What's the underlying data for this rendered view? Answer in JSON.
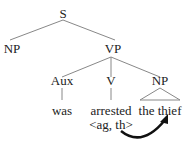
{
  "tree": {
    "root": "S",
    "s_children": [
      "NP",
      "VP"
    ],
    "vp_children": [
      "Aux",
      "V",
      "NP"
    ],
    "aux_word": "was",
    "v_word": "arrested",
    "v_args": "<ag, th>",
    "np_words": "the thief"
  },
  "colors": {
    "line": "#888888",
    "text": "#222222",
    "arrow": "#111111"
  }
}
